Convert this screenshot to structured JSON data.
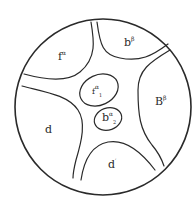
{
  "diagram": {
    "title": "",
    "stroke_color": "#2a2a2a",
    "regions": [
      {
        "id": "top-left",
        "base": "f",
        "sup": "α",
        "sub": ""
      },
      {
        "id": "top-right",
        "base": "b",
        "sup": "β",
        "sub": ""
      },
      {
        "id": "inner-upper",
        "base": "f",
        "sup": "α",
        "sub": "1"
      },
      {
        "id": "inner-lower",
        "base": "b",
        "sup": "α",
        "sub": "2"
      },
      {
        "id": "right",
        "base": "B",
        "sup": "β",
        "sub": ""
      },
      {
        "id": "left",
        "base": "d",
        "sup": "",
        "sub": ""
      },
      {
        "id": "bottom",
        "base": "d",
        "sup": "′",
        "sub": ""
      }
    ]
  }
}
